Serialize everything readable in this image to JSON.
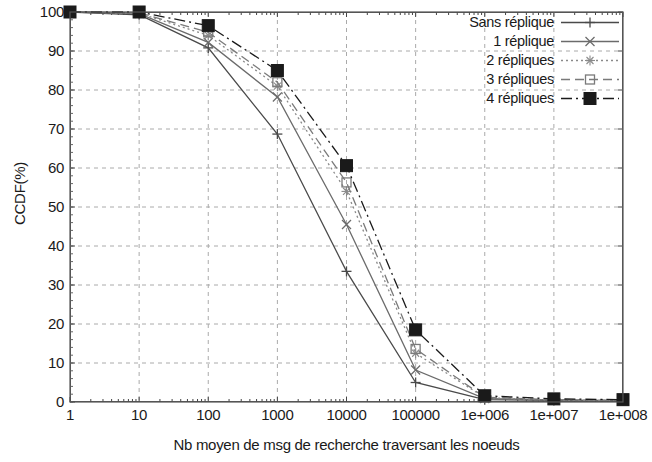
{
  "chart_data": {
    "type": "line",
    "title": "",
    "xlabel": "Nb moyen de msg de recherche traversant les noeuds",
    "ylabel": "CCDF(%)",
    "xscale": "log",
    "xlim": [
      1,
      100000000
    ],
    "ylim": [
      0,
      100
    ],
    "grid": true,
    "legend_position": "top-right",
    "x": [
      1,
      10,
      100,
      1000,
      10000,
      100000,
      1000000,
      10000000,
      100000000
    ],
    "xtick_labels": [
      "1",
      "10",
      "100",
      "1000",
      "10000",
      "100000",
      "1e+006",
      "1e+007",
      "1e+008"
    ],
    "ytick_labels": [
      "0",
      "10",
      "20",
      "30",
      "40",
      "50",
      "60",
      "70",
      "80",
      "90",
      "100"
    ],
    "ytick_values": [
      0,
      10,
      20,
      30,
      40,
      50,
      60,
      70,
      80,
      90,
      100
    ],
    "series": [
      {
        "name": "Sans réplique",
        "marker": "plus",
        "dash": "solid",
        "color": "#4a4a4a",
        "values": [
          100,
          99.3,
          90.8,
          68.7,
          33.5,
          5.0,
          0.6,
          0.4,
          0.3
        ]
      },
      {
        "name": "1 réplique",
        "marker": "cross",
        "dash": "solid",
        "color": "#6b6b6b",
        "values": [
          100,
          99.6,
          92.2,
          78.2,
          45.5,
          8.2,
          0.9,
          0.5,
          0.4
        ]
      },
      {
        "name": "2 répliques",
        "marker": "star",
        "dash": "dotted",
        "color": "#8a8a8a",
        "values": [
          100,
          99.7,
          94.0,
          81.0,
          54.0,
          12.5,
          1.1,
          0.5,
          0.4
        ]
      },
      {
        "name": "3 répliques",
        "marker": "square-open",
        "dash": "dashed",
        "color": "#7a7a7a",
        "values": [
          100,
          99.8,
          94.8,
          82.0,
          56.3,
          13.6,
          1.2,
          0.6,
          0.4
        ]
      },
      {
        "name": "4 répliques",
        "marker": "square-filled",
        "dash": "dashdot",
        "color": "#1a1a1a",
        "values": [
          100,
          100,
          96.5,
          85.0,
          60.6,
          18.5,
          1.6,
          0.8,
          0.6
        ]
      }
    ]
  }
}
